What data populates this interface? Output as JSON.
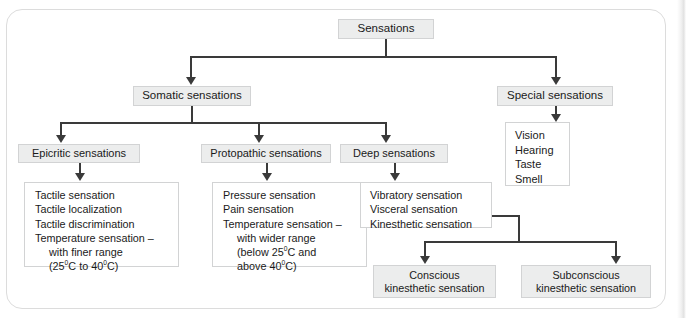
{
  "diagram": {
    "root": {
      "label": "Sensations"
    },
    "level2": {
      "somatic": "Somatic sensations",
      "special": "Special sensations"
    },
    "level3": {
      "epicritic": "Epicritic sensations",
      "protopathic": "Protopathic sensations",
      "deep": "Deep sensations"
    },
    "special_list": {
      "item1": "Vision",
      "item2": "Hearing",
      "item3": "Taste",
      "item4": "Smell"
    },
    "epicritic_list": {
      "item1": "Tactile sensation",
      "item2": "Tactile localization",
      "item3": "Tactile discrimination",
      "item4": "Temperature sensation –",
      "item5": "with finer range",
      "item6_pre": "(25",
      "item6_sup1": "0",
      "item6_mid": "C to 40",
      "item6_sup2": "0",
      "item6_post": "C)"
    },
    "protopathic_list": {
      "item1": "Pressure sensation",
      "item2": "Pain sensation",
      "item3": "Temperature sensation –",
      "item4": "with wider range",
      "item5_pre": "(below 25",
      "item5_sup": "0",
      "item5_post": "C and",
      "item6_pre": "above 40",
      "item6_sup": "0",
      "item6_post": "C)"
    },
    "deep_list": {
      "item1": "Vibratory sensation",
      "item2": "Visceral sensation",
      "item3": "Kinesthetic sensation"
    },
    "kinesthetic_children": {
      "conscious_line1": "Conscious",
      "conscious_line2": "kinesthetic sensation",
      "subconscious_line1": "Subconscious",
      "subconscious_line2": "kinesthetic sensation"
    },
    "colors": {
      "node_fill": "#eceded",
      "node_border": "#d2d3d4",
      "line": "#3a3a3a",
      "text": "#1a1a1a",
      "frame_border": "#dcdcdc",
      "background": "#ffffff"
    }
  }
}
